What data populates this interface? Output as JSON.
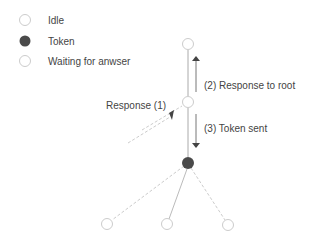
{
  "legend": [
    {
      "label": "Idle",
      "state": "idle"
    },
    {
      "label": "Token",
      "state": "token"
    },
    {
      "label": "Waiting for anwser",
      "state": "waiting"
    }
  ],
  "annotations": {
    "response1": "Response (1)",
    "response_to_root": "(2) Response to root",
    "token_sent": "(3) Token sent"
  },
  "colors": {
    "token_fill": "#4a4a4a",
    "edge": "#bbbbbb",
    "arrow": "#555555"
  }
}
